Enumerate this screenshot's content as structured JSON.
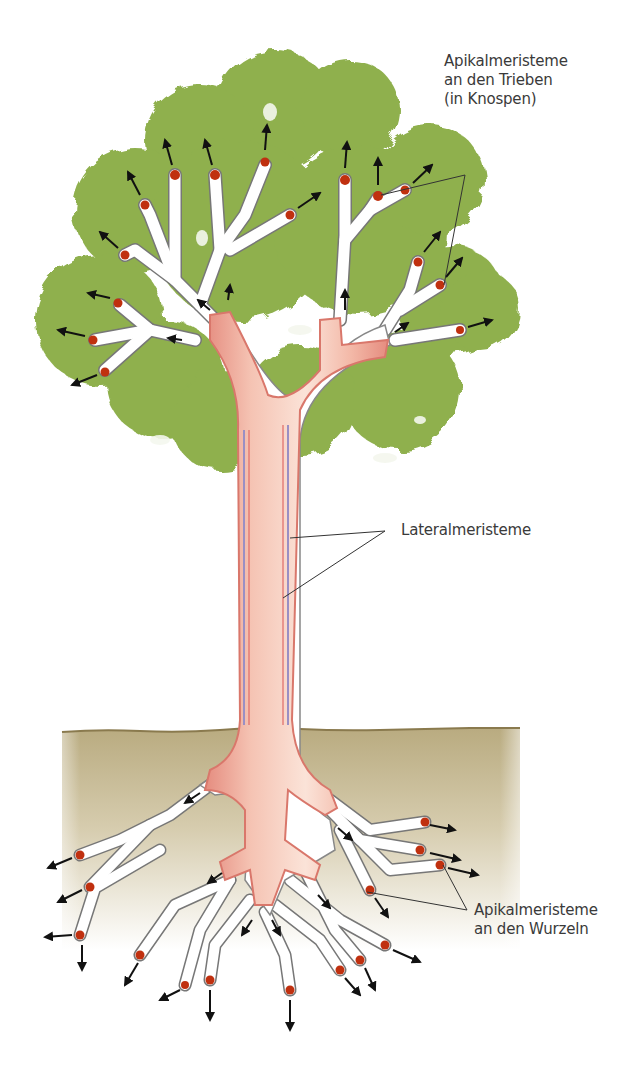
{
  "diagram": {
    "colors": {
      "foliage": "#8fb04e",
      "foliage_dark": "#6f9437",
      "soil": "#c9bd9b",
      "soil_edge": "#8a7a4e",
      "trunk": "#f2b9a8",
      "trunk_edge": "#d9776b",
      "cambium": "#9a8fc4",
      "meristem_tip": "#c0300f",
      "arrow": "#111111",
      "leader_line": "#333333",
      "text": "#3a3a3a"
    },
    "labels": {
      "shoot_apical": {
        "line1": "Apikalmeristeme",
        "line2": "an den Trieben",
        "line3": "(in Knospen)"
      },
      "lateral": {
        "line1": "Lateralmeristeme"
      },
      "root_apical": {
        "line1": "Apikalmeristeme",
        "line2": "an den Wurzeln"
      }
    },
    "shoot_tip_count": 17,
    "root_tip_count": 17
  }
}
